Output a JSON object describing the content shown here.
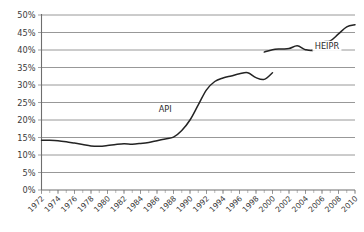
{
  "chart_data": {
    "type": "line",
    "title": "",
    "subtitle": "",
    "xlabel": "",
    "ylabel": "",
    "grid": "horizontal",
    "legend_position": "inline-annotation",
    "xlim": [
      1972,
      2010
    ],
    "ylim": [
      0,
      50
    ],
    "ytick_step": 5,
    "xtick_step": 2,
    "minor_xtick_step": 1,
    "y_tick_labels": [
      "0%",
      "5%",
      "10%",
      "15%",
      "20%",
      "25%",
      "30%",
      "35%",
      "40%",
      "45%",
      "50%"
    ],
    "y_tick_values": [
      0,
      5,
      10,
      15,
      20,
      25,
      30,
      35,
      40,
      45,
      50
    ],
    "x_tick_labels": [
      "1972",
      "1974",
      "1976",
      "1978",
      "1980",
      "1982",
      "1984",
      "1986",
      "1988",
      "1990",
      "1992",
      "1994",
      "1996",
      "1998",
      "2000",
      "2002",
      "2004",
      "2006",
      "2008",
      "2010"
    ],
    "x_tick_values": [
      1972,
      1974,
      1976,
      1978,
      1980,
      1982,
      1984,
      1986,
      1988,
      1990,
      1992,
      1994,
      1996,
      1998,
      2000,
      2002,
      2004,
      2006,
      2008,
      2010
    ],
    "annotations": [
      {
        "text": "API",
        "x": 1987.0,
        "y": 22.8
      },
      {
        "text": "HEIPR",
        "x": 2006.6,
        "y": 40.9
      }
    ],
    "series": [
      {
        "name": "API",
        "color": "#232323",
        "x": [
          1972,
          1973,
          1974,
          1975,
          1976,
          1977,
          1978,
          1979,
          1980,
          1981,
          1982,
          1983,
          1984,
          1985,
          1986,
          1987,
          1988,
          1989,
          1990,
          1991,
          1992,
          1993,
          1994,
          1995,
          1996,
          1997,
          1998,
          1999,
          2000
        ],
        "values": [
          14.2,
          14.2,
          14.1,
          13.8,
          13.4,
          13.0,
          12.6,
          12.5,
          12.7,
          13.0,
          13.2,
          13.1,
          13.3,
          13.6,
          14.1,
          14.6,
          15.1,
          17.0,
          20.0,
          24.3,
          28.6,
          31.0,
          32.0,
          32.6,
          33.2,
          33.5,
          32.1,
          31.6,
          33.5
        ]
      },
      {
        "name": "HEIPR",
        "color": "#232323",
        "x": [
          1999,
          2000,
          2001,
          2002,
          2003,
          2004,
          2005,
          2006,
          2007,
          2008,
          2009,
          2010
        ],
        "values": [
          39.4,
          40.1,
          40.3,
          40.4,
          41.2,
          40.1,
          40.0,
          42.2,
          42.6,
          44.6,
          46.6,
          47.2
        ]
      }
    ]
  }
}
